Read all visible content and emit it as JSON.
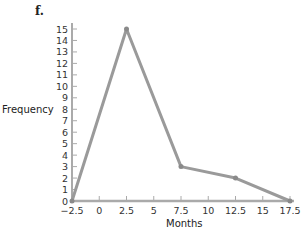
{
  "figure_label": "f.",
  "chart_data": {
    "type": "line",
    "title": "",
    "xlabel": "Months",
    "ylabel": "Frequency",
    "x": [
      -2.5,
      2.5,
      7.5,
      12.5,
      17.5
    ],
    "values": [
      0,
      15,
      3,
      2,
      0
    ],
    "x_ticks": [
      "-2.5",
      "0",
      "2.5",
      "5",
      "7.5",
      "10",
      "12.5",
      "15",
      "17.5"
    ],
    "y_ticks": [
      "0",
      "1",
      "2",
      "3",
      "4",
      "5",
      "6",
      "7",
      "8",
      "9",
      "10",
      "11",
      "12",
      "13",
      "14",
      "15"
    ],
    "xlim": [
      -2.5,
      17.5
    ],
    "ylim": [
      0,
      15
    ],
    "grid": false,
    "legend": null,
    "line_color": "#9a9a9a",
    "axis_color": "#aaaaaa"
  }
}
